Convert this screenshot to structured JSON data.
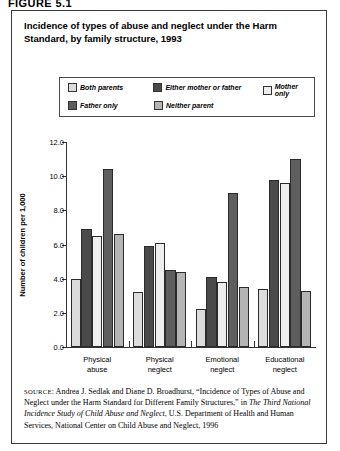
{
  "figure_label": "FIGURE 5.1",
  "title": "Incidence of types of abuse and neglect under the Harm Standard, by family structure, 1993",
  "legend": {
    "row1": [
      {
        "label": "Both parents",
        "color": "#dcdcdc"
      },
      {
        "label": "Either mother or father",
        "color": "#4a4a4a"
      },
      {
        "label": "Mother only",
        "color": "#eeeeee"
      }
    ],
    "row2": [
      {
        "label": "Father only",
        "color": "#5e5e5e"
      },
      {
        "label": "Neither parent",
        "color": "#b4b4b4"
      }
    ]
  },
  "source": {
    "prefix": "SOURCE",
    "text_1": ": Andrea J. Sedlak and Diane D. Broadhurst, “Incidence of Types of Abuse and Neglect under the Harm Standard for Different Family Structures,” in ",
    "italic_1": "The Third National Incidence Study of Child Abuse and Neglect",
    "text_2": ", U.S. Department of Health and Human Services, National Center on Child Abuse and Neglect, 1996"
  },
  "chart_data": {
    "type": "bar",
    "title": "Incidence of types of abuse and neglect under the Harm Standard, by family structure, 1993",
    "xlabel": "",
    "ylabel": "Number of children per 1,000",
    "ylim": [
      0.0,
      12.0
    ],
    "yticks": [
      "0.0",
      "2.0",
      "4.0",
      "6.0",
      "8.0",
      "10.0",
      "12.0"
    ],
    "grid": false,
    "legend_position": "top",
    "categories": [
      "Physical abuse",
      "Physical neglect",
      "Emotional neglect",
      "Educational neglect"
    ],
    "category_lines": [
      [
        "Physical",
        "abuse"
      ],
      [
        "Physical",
        "neglect"
      ],
      [
        "Emotional",
        "neglect"
      ],
      [
        "Educational",
        "neglect"
      ]
    ],
    "series": [
      {
        "name": "Both parents",
        "color": "#dcdcdc",
        "values": [
          4.0,
          3.2,
          2.2,
          3.4
        ]
      },
      {
        "name": "Either mother or father",
        "color": "#4a4a4a",
        "values": [
          6.9,
          5.9,
          4.1,
          9.8
        ]
      },
      {
        "name": "Mother only",
        "color": "#eeeeee",
        "values": [
          6.5,
          6.1,
          3.8,
          9.6
        ]
      },
      {
        "name": "Father only",
        "color": "#5e5e5e",
        "values": [
          10.4,
          4.5,
          9.0,
          11.0
        ]
      },
      {
        "name": "Neither parent",
        "color": "#b4b4b4",
        "values": [
          6.6,
          4.4,
          3.5,
          3.3
        ]
      }
    ]
  }
}
